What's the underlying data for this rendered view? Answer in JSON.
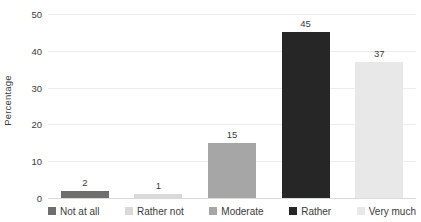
{
  "chart_data": {
    "type": "bar",
    "title": "",
    "xlabel": "",
    "ylabel": "Percentage",
    "ylim": [
      0,
      50
    ],
    "ytick_labels": [
      "0",
      "10",
      "20",
      "30",
      "40",
      "50"
    ],
    "ytick_values": [
      0,
      10,
      20,
      30,
      40,
      50
    ],
    "grid": true,
    "legend_position": "bottom",
    "categories": [
      "Not at all",
      "Rather not",
      "Moderate",
      "Rather",
      "Very much"
    ],
    "values": [
      2,
      1,
      15,
      45,
      37
    ],
    "data_labels": [
      "2",
      "1",
      "15",
      "45",
      "37"
    ],
    "series": [
      {
        "name": "Percentage",
        "values": [
          2,
          1,
          15,
          45,
          37
        ]
      }
    ],
    "bar_colors": [
      "#6E6E6E",
      "#D9D9D9",
      "#A6A6A6",
      "#262626",
      "#E8E8E8"
    ]
  },
  "colors": {
    "gridline": "#ECEDED",
    "baseline": "#D9DADB",
    "text": "#3B3B3B",
    "background": "#FFFFFF"
  },
  "legend": {
    "items": [
      {
        "label": "Not at all",
        "color": "#6E6E6E"
      },
      {
        "label": "Rather not",
        "color": "#D9D9D9"
      },
      {
        "label": "Moderate",
        "color": "#A6A6A6"
      },
      {
        "label": "Rather",
        "color": "#262626"
      },
      {
        "label": "Very much",
        "color": "#E8E8E8"
      }
    ]
  }
}
